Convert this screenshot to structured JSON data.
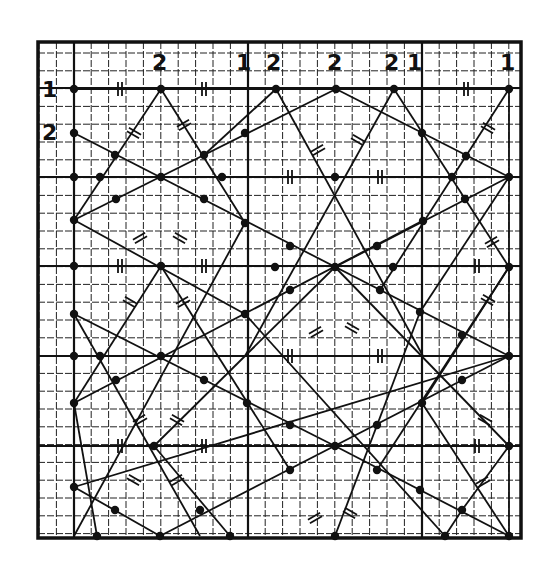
{
  "figure": {
    "width": 548,
    "height": 575,
    "colors": {
      "ink": "#111111",
      "paper": "#ffffff",
      "grid": "#222222"
    },
    "frame": {
      "x0": 38,
      "y0": 42,
      "x1": 521,
      "y1": 538
    },
    "grid": {
      "minor_x_start": 39,
      "minor_x_step": 17.4,
      "minor_y_start": 53,
      "minor_y_step": 17.8,
      "heavy_x": [
        74,
        248,
        422
      ],
      "heavy_y": [
        88,
        177,
        266,
        356,
        446
      ]
    }
  },
  "labels": [
    {
      "text": "1",
      "x": 42,
      "y": 97
    },
    {
      "text": "2",
      "x": 42,
      "y": 140
    },
    {
      "text": "2",
      "x": 152,
      "y": 70
    },
    {
      "text": "1",
      "x": 236,
      "y": 70
    },
    {
      "text": "2",
      "x": 266,
      "y": 70
    },
    {
      "text": "2",
      "x": 327,
      "y": 70
    },
    {
      "text": "2",
      "x": 384,
      "y": 70
    },
    {
      "text": "1",
      "x": 407,
      "y": 70
    },
    {
      "text": "1",
      "x": 500,
      "y": 70
    }
  ],
  "dots": [
    [
      74,
      89
    ],
    [
      161,
      89
    ],
    [
      276,
      89
    ],
    [
      336,
      89
    ],
    [
      394,
      89
    ],
    [
      509,
      89
    ],
    [
      74,
      133
    ],
    [
      115,
      155
    ],
    [
      204,
      155
    ],
    [
      245,
      133
    ],
    [
      422,
      133
    ],
    [
      74,
      177
    ],
    [
      100,
      177
    ],
    [
      161,
      177
    ],
    [
      222,
      177
    ],
    [
      335,
      177
    ],
    [
      452,
      177
    ],
    [
      509,
      177
    ],
    [
      116,
      199
    ],
    [
      204,
      199
    ],
    [
      74,
      220
    ],
    [
      466,
      156
    ],
    [
      465,
      199
    ],
    [
      423,
      221
    ],
    [
      290,
      246
    ],
    [
      377,
      246
    ],
    [
      245,
      223
    ],
    [
      74,
      266
    ],
    [
      161,
      266
    ],
    [
      275,
      267
    ],
    [
      335,
      267
    ],
    [
      393,
      267
    ],
    [
      509,
      267
    ],
    [
      290,
      290
    ],
    [
      380,
      290
    ],
    [
      245,
      314
    ],
    [
      420,
      312
    ],
    [
      74,
      314
    ],
    [
      462,
      335
    ],
    [
      100,
      356
    ],
    [
      161,
      356
    ],
    [
      116,
      380
    ],
    [
      204,
      380
    ],
    [
      247,
      403
    ],
    [
      290,
      425
    ],
    [
      377,
      425
    ],
    [
      422,
      403
    ],
    [
      462,
      380
    ],
    [
      509,
      356
    ],
    [
      74,
      403
    ],
    [
      154,
      446
    ],
    [
      335,
      446
    ],
    [
      509,
      446
    ],
    [
      74,
      356
    ],
    [
      74,
      487
    ],
    [
      115,
      510
    ],
    [
      200,
      510
    ],
    [
      290,
      470
    ],
    [
      377,
      470
    ],
    [
      462,
      510
    ],
    [
      420,
      490
    ],
    [
      97,
      536
    ],
    [
      160,
      536
    ],
    [
      230,
      536
    ],
    [
      335,
      536
    ],
    [
      445,
      536
    ],
    [
      509,
      536
    ]
  ],
  "segments": [
    [
      [
        74,
        89
      ],
      [
        509,
        89
      ]
    ],
    [
      [
        161,
        89
      ],
      [
        74,
        220
      ]
    ],
    [
      [
        161,
        89
      ],
      [
        245,
        223
      ]
    ],
    [
      [
        276,
        89
      ],
      [
        204,
        155
      ]
    ],
    [
      [
        74,
        220
      ],
      [
        336,
        89
      ]
    ],
    [
      [
        336,
        89
      ],
      [
        509,
        177
      ]
    ],
    [
      [
        276,
        89
      ],
      [
        423,
        356
      ]
    ],
    [
      [
        394,
        89
      ],
      [
        245,
        356
      ]
    ],
    [
      [
        394,
        89
      ],
      [
        509,
        267
      ]
    ],
    [
      [
        509,
        89
      ],
      [
        380,
        290
      ]
    ],
    [
      [
        74,
        133
      ],
      [
        509,
        356
      ]
    ],
    [
      [
        74,
        177
      ],
      [
        509,
        177
      ]
    ],
    [
      [
        74,
        266
      ],
      [
        509,
        266
      ]
    ],
    [
      [
        74,
        356
      ],
      [
        509,
        356
      ]
    ],
    [
      [
        74,
        446
      ],
      [
        509,
        446
      ]
    ],
    [
      [
        74,
        89
      ],
      [
        74,
        536
      ]
    ],
    [
      [
        509,
        89
      ],
      [
        509,
        536
      ]
    ],
    [
      [
        74,
        220
      ],
      [
        245,
        314
      ]
    ],
    [
      [
        509,
        177
      ],
      [
        335,
        267
      ]
    ],
    [
      [
        509,
        177
      ],
      [
        420,
        312
      ]
    ],
    [
      [
        74,
        403
      ],
      [
        422,
        221
      ]
    ],
    [
      [
        74,
        314
      ],
      [
        200,
        536
      ]
    ],
    [
      [
        74,
        314
      ],
      [
        335,
        446
      ]
    ],
    [
      [
        245,
        223
      ],
      [
        74,
        536
      ]
    ],
    [
      [
        74,
        487
      ],
      [
        160,
        536
      ]
    ],
    [
      [
        161,
        266
      ],
      [
        290,
        470
      ]
    ],
    [
      [
        161,
        266
      ],
      [
        74,
        403
      ]
    ],
    [
      [
        335,
        267
      ],
      [
        154,
        446
      ]
    ],
    [
      [
        335,
        267
      ],
      [
        509,
        446
      ]
    ],
    [
      [
        509,
        267
      ],
      [
        377,
        470
      ]
    ],
    [
      [
        509,
        267
      ],
      [
        422,
        403
      ]
    ],
    [
      [
        422,
        403
      ],
      [
        509,
        536
      ]
    ],
    [
      [
        509,
        356
      ],
      [
        160,
        536
      ]
    ],
    [
      [
        74,
        487
      ],
      [
        509,
        356
      ]
    ],
    [
      [
        245,
        314
      ],
      [
        445,
        536
      ]
    ],
    [
      [
        420,
        312
      ],
      [
        335,
        536
      ]
    ],
    [
      [
        154,
        446
      ],
      [
        230,
        536
      ]
    ],
    [
      [
        335,
        446
      ],
      [
        509,
        536
      ]
    ],
    [
      [
        509,
        446
      ],
      [
        462,
        510
      ]
    ],
    [
      [
        462,
        510
      ],
      [
        445,
        536
      ]
    ],
    [
      [
        74,
        403
      ],
      [
        97,
        536
      ]
    ]
  ],
  "tick_marks": [
    {
      "x": 120,
      "y": 89,
      "angle": 0,
      "count": 2
    },
    {
      "x": 204,
      "y": 89,
      "angle": 0,
      "count": 2
    },
    {
      "x": 466,
      "y": 89,
      "angle": 0,
      "count": 2
    },
    {
      "x": 120,
      "y": 266,
      "angle": 0,
      "count": 2
    },
    {
      "x": 204,
      "y": 266,
      "angle": 0,
      "count": 2
    },
    {
      "x": 290,
      "y": 177,
      "angle": 0,
      "count": 2
    },
    {
      "x": 380,
      "y": 177,
      "angle": 0,
      "count": 2
    },
    {
      "x": 290,
      "y": 356,
      "angle": 0,
      "count": 2
    },
    {
      "x": 380,
      "y": 356,
      "angle": 0,
      "count": 2
    },
    {
      "x": 120,
      "y": 446,
      "angle": 0,
      "count": 2
    },
    {
      "x": 204,
      "y": 446,
      "angle": 0,
      "count": 2
    },
    {
      "x": 477,
      "y": 266,
      "angle": 0,
      "count": 2
    },
    {
      "x": 477,
      "y": 446,
      "angle": 0,
      "count": 2
    },
    {
      "x": 134,
      "y": 133,
      "angle": -60,
      "count": 2
    },
    {
      "x": 184,
      "y": 125,
      "angle": 60,
      "count": 2
    },
    {
      "x": 318,
      "y": 150,
      "angle": 60,
      "count": 2
    },
    {
      "x": 358,
      "y": 140,
      "angle": -60,
      "count": 2
    },
    {
      "x": 488,
      "y": 128,
      "angle": -60,
      "count": 2
    },
    {
      "x": 140,
      "y": 238,
      "angle": 60,
      "count": 2
    },
    {
      "x": 180,
      "y": 238,
      "angle": -60,
      "count": 2
    },
    {
      "x": 130,
      "y": 302,
      "angle": -60,
      "count": 2
    },
    {
      "x": 183,
      "y": 302,
      "angle": 60,
      "count": 2
    },
    {
      "x": 316,
      "y": 332,
      "angle": 60,
      "count": 2
    },
    {
      "x": 352,
      "y": 328,
      "angle": -60,
      "count": 2
    },
    {
      "x": 492,
      "y": 242,
      "angle": 60,
      "count": 2
    },
    {
      "x": 488,
      "y": 300,
      "angle": -60,
      "count": 2
    },
    {
      "x": 140,
      "y": 420,
      "angle": 60,
      "count": 2
    },
    {
      "x": 177,
      "y": 420,
      "angle": -60,
      "count": 2
    },
    {
      "x": 134,
      "y": 480,
      "angle": -60,
      "count": 2
    },
    {
      "x": 177,
      "y": 480,
      "angle": 60,
      "count": 2
    },
    {
      "x": 315,
      "y": 518,
      "angle": 60,
      "count": 2
    },
    {
      "x": 350,
      "y": 513,
      "angle": -60,
      "count": 2
    },
    {
      "x": 485,
      "y": 420,
      "angle": -60,
      "count": 2
    },
    {
      "x": 483,
      "y": 482,
      "angle": 60,
      "count": 2
    }
  ]
}
